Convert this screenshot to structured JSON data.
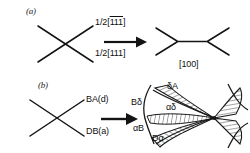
{
  "figure": {
    "type": "dislocation-reaction-diagram",
    "background": "#ffffff",
    "ink": "#111111"
  },
  "panel_a": {
    "label": "(a)",
    "arrow": "rightwards-arrow",
    "left_diagram": {
      "name": "crossing-dislocations",
      "shape": "X-crossing"
    },
    "labels": {
      "upper": {
        "prefix": "1/2[",
        "indices": "111",
        "overbar": true,
        "suffix": "]",
        "full": "1/2[1̅1̅1̅]"
      },
      "lower": {
        "prefix": "1/2[",
        "indices": "111",
        "overbar": false,
        "suffix": "]",
        "full": "1/2[111]"
      }
    },
    "right_diagram": {
      "name": "reacted-node-pair",
      "shape": "double-Y-junction",
      "label": "[100]"
    }
  },
  "panel_b": {
    "label": "(b)",
    "arrow": "rightwards-arrow",
    "left_diagram": {
      "name": "crossing-dislocations",
      "shape": "X-crossing"
    },
    "labels": {
      "upper": "BA(d)",
      "lower": "DB(a)"
    },
    "right_diagram": {
      "name": "dissociated-node-network",
      "labels": {
        "delta_a": "δA",
        "b_delta": "Bδ",
        "alpha_delta": "αδ",
        "alpha_b": "αB",
        "d_alpha": "Dα"
      }
    }
  }
}
